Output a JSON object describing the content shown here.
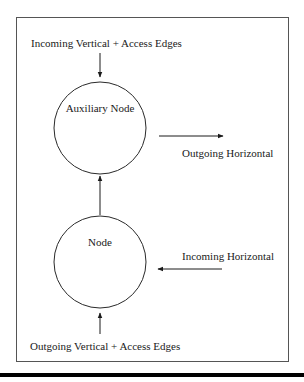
{
  "diagram": {
    "type": "node-structure",
    "nodes": [
      {
        "id": "auxiliary",
        "label": "Auxiliary Node",
        "cx": 100,
        "cy": 128,
        "r": 46
      },
      {
        "id": "node",
        "label": "Node",
        "cx": 100,
        "cy": 262,
        "r": 46
      }
    ],
    "edges": [
      {
        "id": "incoming-vertical",
        "label": "Incoming Vertical + Access Edges",
        "from": "outside-top",
        "to": "auxiliary"
      },
      {
        "id": "outgoing-horizontal",
        "label": "Outgoing Horizontal",
        "from": "auxiliary",
        "to": "outside-right"
      },
      {
        "id": "node-to-auxiliary",
        "label": "",
        "from": "node",
        "to": "auxiliary"
      },
      {
        "id": "incoming-horizontal",
        "label": "Incoming Horizontal",
        "from": "outside-right",
        "to": "node"
      },
      {
        "id": "outgoing-vertical",
        "label": "Outgoing Vertical + Access Edges",
        "from": "outside-bottom",
        "to": "node"
      }
    ]
  },
  "labels": {
    "incoming_vertical": "Incoming Vertical + Access Edges",
    "auxiliary_node": "Auxiliary Node",
    "outgoing_horizontal": "Outgoing Horizontal",
    "node": "Node",
    "incoming_horizontal": "Incoming Horizontal",
    "outgoing_vertical": "Outgoing Vertical + Access Edges"
  },
  "colors": {
    "stroke": "#2a2a2a",
    "frame": "#555555",
    "rule": "#000000",
    "background": "#ffffff"
  }
}
